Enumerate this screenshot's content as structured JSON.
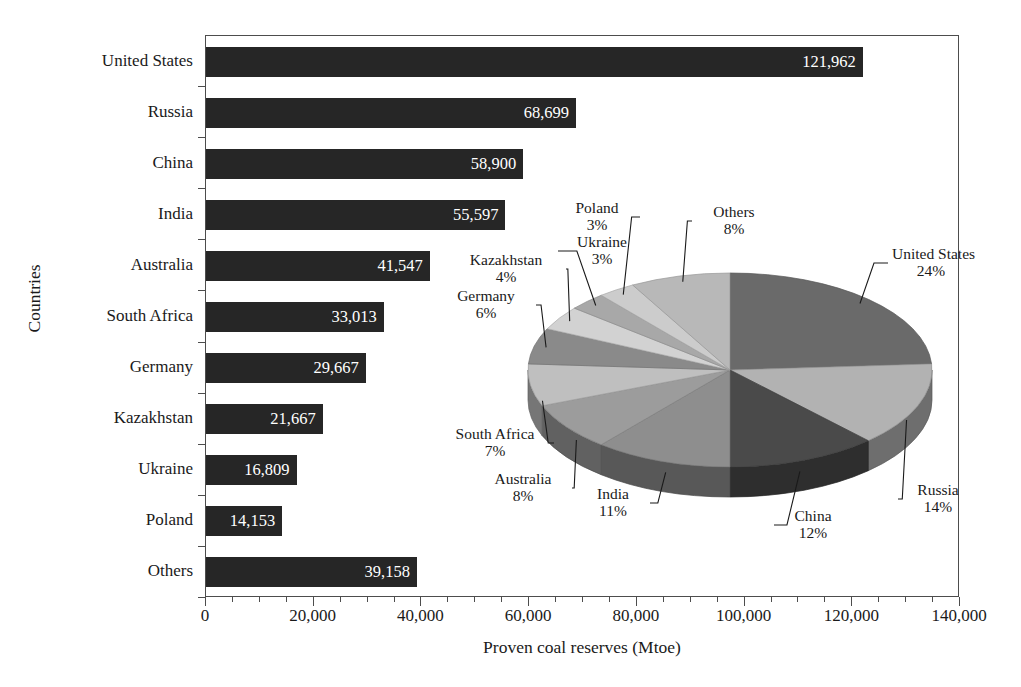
{
  "chart_data": {
    "type": "bar",
    "title": "",
    "xlabel": "Proven coal reserves (Mtoe)",
    "ylabel": "Countries",
    "categories": [
      "United States",
      "Russia",
      "China",
      "India",
      "Australia",
      "South Africa",
      "Germany",
      "Kazakhstan",
      "Ukraine",
      "Poland",
      "Others"
    ],
    "values": [
      121962,
      68699,
      58900,
      55597,
      41547,
      33013,
      29667,
      21667,
      16809,
      14153,
      39158
    ],
    "value_labels": [
      "121,962",
      "68,699",
      "58,900",
      "55,597",
      "41,547",
      "33,013",
      "29,667",
      "21,667",
      "16,809",
      "14,153",
      "39,158"
    ],
    "xlim": [
      0,
      140000
    ],
    "xticks": [
      0,
      20000,
      40000,
      60000,
      80000,
      100000,
      120000,
      140000
    ],
    "xtick_labels": [
      "0",
      "20,000",
      "40,000",
      "60,000",
      "80,000",
      "100,000",
      "120,000",
      "140,000"
    ],
    "xtick_minor_step": 5000,
    "grid": false,
    "legend": "none",
    "bar_color": "#262626",
    "value_label_color": "#ffffff",
    "axis_color": "#4d4d4d"
  },
  "pie_data": {
    "type": "pie",
    "title": "",
    "style": "3d-exploded-none",
    "start_angle_deg": 0,
    "direction": "clockwise",
    "labels": [
      "United States",
      "Russia",
      "China",
      "India",
      "Australia",
      "South Africa",
      "Germany",
      "Kazakhstan",
      "Ukraine",
      "Poland",
      "Others"
    ],
    "values": [
      24,
      14,
      12,
      11,
      8,
      7,
      6,
      4,
      3,
      3,
      8
    ],
    "pct_labels": [
      "24%",
      "14%",
      "12%",
      "11%",
      "8%",
      "7%",
      "6%",
      "4%",
      "3%",
      "3%",
      "8%"
    ],
    "slice_colors": [
      "#6a6a6a",
      "#b2b2b2",
      "#4a4a4a",
      "#8e8e8e",
      "#9c9c9c",
      "#bfbfbf",
      "#8a8a8a",
      "#d2d2d2",
      "#a8a8a8",
      "#cccccc",
      "#b8b8b8"
    ],
    "leader_line_color": "#1a1a1a"
  },
  "pie_label_positions": [
    {
      "label": "United States",
      "pct": "24%",
      "x": 452,
      "y": 60,
      "w": 78,
      "align": "center"
    },
    {
      "label": "Russia",
      "pct": "14%",
      "x": 462,
      "y": 296,
      "w": 72,
      "align": "center"
    },
    {
      "label": "China",
      "pct": "12%",
      "x": 338,
      "y": 322,
      "w": 70,
      "align": "center"
    },
    {
      "label": "India",
      "pct": "11%",
      "x": 140,
      "y": 300,
      "w": 66,
      "align": "center"
    },
    {
      "label": "Australia",
      "pct": "8%",
      "x": 38,
      "y": 285,
      "w": 90,
      "align": "center"
    },
    {
      "label": "South Africa",
      "pct": "7%",
      "x": 0,
      "y": 240,
      "w": 110,
      "align": "center"
    },
    {
      "label": "Germany",
      "pct": "6%",
      "x": 0,
      "y": 102,
      "w": 92,
      "align": "center"
    },
    {
      "label": "Kazakhstan",
      "pct": "4%",
      "x": 10,
      "y": 66,
      "w": 112,
      "align": "center"
    },
    {
      "label": "Ukraine",
      "pct": "3%",
      "x": 122,
      "y": 48,
      "w": 80,
      "align": "center"
    },
    {
      "label": "Poland",
      "pct": "3%",
      "x": 118,
      "y": 14,
      "w": 78,
      "align": "center"
    },
    {
      "label": "Others",
      "pct": "8%",
      "x": 256,
      "y": 18,
      "w": 76,
      "align": "center"
    }
  ]
}
